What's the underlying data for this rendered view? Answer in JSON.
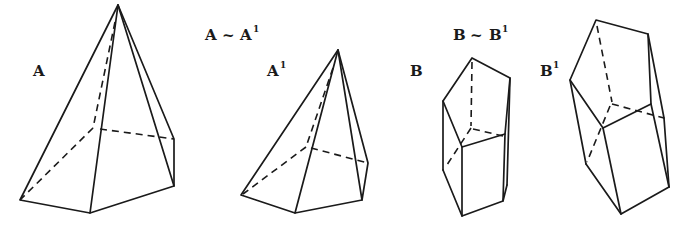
{
  "figure": {
    "relations": [
      {
        "left": "A",
        "symbol": "~",
        "right": "A",
        "right_superscript": "1"
      },
      {
        "left": "B",
        "symbol": "~",
        "right": "B",
        "right_superscript": "1"
      }
    ],
    "solids": [
      {
        "id": "A",
        "label": "A",
        "superscript": "",
        "type": "pentagonal pyramid"
      },
      {
        "id": "A1",
        "label": "A",
        "superscript": "1",
        "type": "pentagonal pyramid"
      },
      {
        "id": "B",
        "label": "B",
        "superscript": "",
        "type": "pentagonal prism"
      },
      {
        "id": "B1",
        "label": "B",
        "superscript": "1",
        "type": "pentagonal prism"
      }
    ],
    "line_color": "#1a1a1a",
    "background": "#ffffff"
  }
}
